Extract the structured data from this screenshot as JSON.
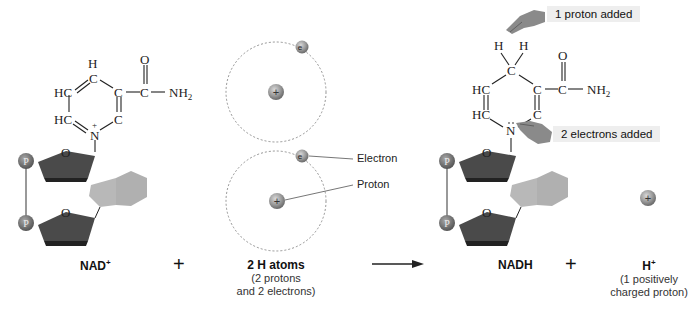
{
  "reactants": {
    "nad": {
      "label": "NAD",
      "charge": "+",
      "ring_atoms": {
        "h_top": "H",
        "c_top": "C",
        "hc_upper": "HC",
        "hc_lower": "HC",
        "c_right": "C",
        "c_lower": "C",
        "n": "N",
        "n_charge": "+",
        "c_amide": "C",
        "o_amide": "O",
        "nh2": "NH",
        "nh2_sub": "2"
      },
      "sugar_o": "O",
      "phosphate": "P"
    },
    "plus_1": "+",
    "h_atoms": {
      "label": "2 H atoms",
      "sub_line1": "(2 protons",
      "sub_line2": "and 2 electrons)",
      "electron_label": "Electron",
      "proton_label": "Proton",
      "electron_symbol": "e",
      "proton_symbol": "+"
    }
  },
  "arrow": "reaction-arrow",
  "products": {
    "nadh": {
      "label": "NADH",
      "ring_atoms": {
        "h1": "H",
        "h2": "H",
        "c_top": "C",
        "hc_upper": "HC",
        "hc_lower": "HC",
        "c_right": "C",
        "c_lower": "C",
        "n": "N",
        "c_amide": "C",
        "o_amide": "O",
        "nh2": "NH",
        "nh2_sub": "2"
      },
      "sugar_o": "O",
      "phosphate": "P",
      "callout_proton": "1 proton added",
      "callout_electrons": "2 electrons added"
    },
    "plus_2": "+",
    "h_ion": {
      "label": "H",
      "charge": "+",
      "sub_line1": "(1 positively",
      "sub_line2": "charged proton)",
      "symbol": "+"
    }
  },
  "colors": {
    "sugar": "#4a4a4a",
    "sugar_bottom": "#2a2a2a",
    "base": "#b8b8b8",
    "phosphate": "#7a7a7a",
    "particle": "#9a9a9a",
    "callout_bg": "#eeeeee"
  }
}
